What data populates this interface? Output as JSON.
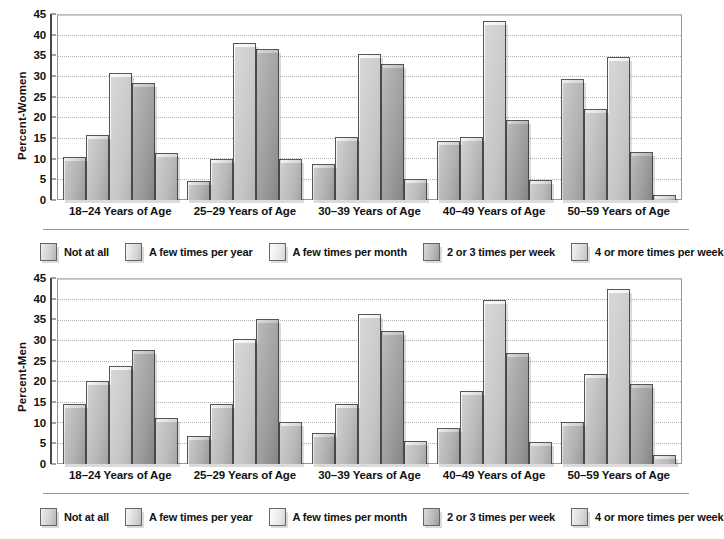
{
  "chart_data": [
    {
      "type": "bar",
      "title": "",
      "xlabel": "",
      "ylabel": "Percent-Women",
      "ylim": [
        0,
        45
      ],
      "ytick_step": 5,
      "yticks": [
        "0",
        "5",
        "10",
        "15",
        "20",
        "25",
        "30",
        "35",
        "40",
        "45"
      ],
      "grid": true,
      "legend_position": "bottom",
      "categories": [
        "18–24 Years of Age",
        "25–29 Years of Age",
        "30–39 Years of Age",
        "40–49 Years of Age",
        "50–59 Years of Age"
      ],
      "series": [
        {
          "name": "Not at all",
          "values": [
            10.5,
            4.6,
            8.8,
            14.3,
            29.5
          ]
        },
        {
          "name": "A few times per year",
          "values": [
            15.7,
            9.9,
            15.4,
            15.4,
            22.2
          ]
        },
        {
          "name": "A few times per month",
          "values": [
            31.0,
            38.3,
            35.6,
            43.6,
            34.7
          ]
        },
        {
          "name": "2 or 3 times per week",
          "values": [
            28.5,
            36.7,
            33.0,
            19.5,
            11.8
          ]
        },
        {
          "name": "4 or more times per week",
          "values": [
            11.4,
            9.9,
            5.1,
            4.9,
            1.1
          ]
        }
      ]
    },
    {
      "type": "bar",
      "title": "",
      "xlabel": "",
      "ylabel": "Percent-Men",
      "ylim": [
        0,
        45
      ],
      "ytick_step": 5,
      "yticks": [
        "0",
        "5",
        "10",
        "15",
        "20",
        "25",
        "30",
        "35",
        "40",
        "45"
      ],
      "grid": true,
      "legend_position": "bottom",
      "categories": [
        "18–24 Years of Age",
        "25–29 Years of Age",
        "30–39 Years of Age",
        "40–49 Years of Age",
        "50–59 Years of Age"
      ],
      "series": [
        {
          "name": "Not at all",
          "values": [
            14.7,
            6.8,
            7.5,
            8.8,
            10.3
          ]
        },
        {
          "name": "A few times per year",
          "values": [
            20.1,
            14.7,
            14.6,
            17.7,
            21.8
          ]
        },
        {
          "name": "A few times per month",
          "values": [
            23.8,
            30.4,
            36.4,
            39.8,
            42.6
          ]
        },
        {
          "name": "2 or 3 times per week",
          "values": [
            27.7,
            35.2,
            32.4,
            27.1,
            19.4
          ]
        },
        {
          "name": "4 or more times per week",
          "values": [
            11.3,
            10.2,
            5.5,
            5.4,
            2.3
          ]
        }
      ]
    }
  ],
  "colors": {
    "series_0": "#d9d9d9",
    "series_1": "#e3e3e3",
    "series_2": "#efefef",
    "series_3": "#b9b9b9",
    "series_4": "#e6e6e6",
    "axis": "#4a4a4a",
    "grid": "#b3b3b3",
    "text": "#111111"
  }
}
